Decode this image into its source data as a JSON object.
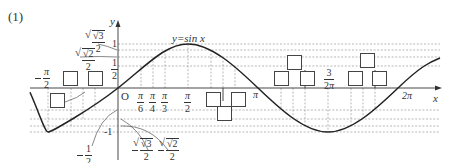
{
  "problem": {
    "number": "(1)"
  },
  "function_label": "y=sin x",
  "axes": {
    "x_label": "x",
    "y_label": "y",
    "origin_label": "O",
    "x_ticks": [
      {
        "label_num": "π",
        "label_den": "6",
        "value": "pi/6"
      },
      {
        "label_num": "π",
        "label_den": "4",
        "value": "pi/4"
      },
      {
        "label_num": "π",
        "label_den": "3",
        "value": "pi/3"
      },
      {
        "label_num": "π",
        "label_den": "2",
        "value": "pi/2"
      },
      {
        "label": "π",
        "value": "pi"
      },
      {
        "label_num": "3",
        "label_den": "2",
        "label_suffix": "π",
        "value": "3pi/2"
      },
      {
        "label": "2π",
        "value": "2pi"
      },
      {
        "label_num": "π",
        "label_den": "2",
        "negative": true,
        "value": "-pi/2"
      }
    ],
    "y_ticks": [
      {
        "label": "1",
        "value": 1
      },
      {
        "label_num": "1",
        "label_den": "2",
        "value": 0.5
      },
      {
        "label": "-1",
        "value": -1
      }
    ],
    "y_callouts": [
      {
        "label_num": "√3",
        "label_den": "2",
        "value": 0.866
      },
      {
        "label_num": "√2",
        "label_den": "2",
        "value": 0.707
      },
      {
        "label_num": "1",
        "label_den": "2",
        "negative": true,
        "value": -0.5
      },
      {
        "label_num": "√3",
        "label_den": "2",
        "negative": true,
        "value": -0.866
      },
      {
        "label_num": "√2",
        "label_den": "2",
        "negative": true,
        "value": -0.707
      }
    ]
  },
  "answer_boxes_count": 13,
  "colors": {
    "curve": "#222222",
    "axis": "#333333",
    "dashed": "#888888",
    "box_border": "#444444"
  }
}
